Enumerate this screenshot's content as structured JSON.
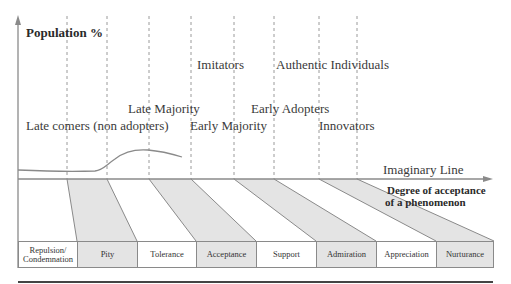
{
  "y_axis": {
    "title": "Population %"
  },
  "x_axis": {
    "title_line1": "Degree of acceptance",
    "title_line2": "of a phenomenon",
    "line_label": "Imaginary Line"
  },
  "adopter_labels": [
    {
      "text": "Late comers (non adopters)"
    },
    {
      "text": "Late Majority"
    },
    {
      "text": "Early Majority"
    },
    {
      "text": "Imitators"
    },
    {
      "text": "Early Adopters"
    },
    {
      "text": "Authentic Individuals"
    },
    {
      "text": "Innovators"
    }
  ],
  "acceptance_stages": [
    {
      "line1": "Repulsion/",
      "line2": "Condemnation",
      "shaded": false
    },
    {
      "line1": "Pity",
      "line2": "",
      "shaded": true
    },
    {
      "line1": "Tolerance",
      "line2": "",
      "shaded": false
    },
    {
      "line1": "Acceptance",
      "line2": "",
      "shaded": true
    },
    {
      "line1": "Support",
      "line2": "",
      "shaded": false
    },
    {
      "line1": "Admiration",
      "line2": "",
      "shaded": true
    },
    {
      "line1": "Appreciation",
      "line2": "",
      "shaded": false
    },
    {
      "line1": "Nurturance",
      "line2": "",
      "shaded": true
    }
  ],
  "colors": {
    "line": "#8a8a8a",
    "shade": "#e4e4e4",
    "text": "#3a3a3a"
  }
}
